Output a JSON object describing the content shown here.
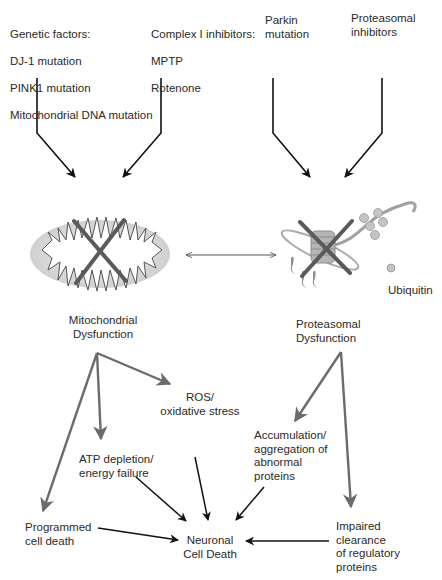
{
  "diagram": {
    "inputs": {
      "genetic": {
        "title": "Genetic factors:",
        "items": [
          "DJ-1 mutation",
          "PINK1 mutation",
          "Mitochondrial DNA mutation"
        ]
      },
      "complex1": {
        "title": "Complex I inhibitors:",
        "items": [
          "MPTP",
          "Rotenone"
        ]
      },
      "parkin": {
        "text": "Parkin\nmutation"
      },
      "proteasomal_inhibitors": {
        "text": "Proteasomal\ninhibitors"
      }
    },
    "organelles": {
      "mitochondrion": {
        "label": "Mitochondrial\nDysfunction",
        "blocked": true
      },
      "proteasome": {
        "label": "Proteasomal\nDysfunction",
        "blocked": true,
        "ubiquitin_label": "Ubiquitin"
      }
    },
    "outcomes": {
      "ros": "ROS/\noxidative stress",
      "atp": "ATP depletion/\nenergy failure",
      "programmed": "Programmed\ncell death",
      "accumulation": "Accumulation/\naggregation of\nabnormal\nproteins",
      "impaired": "Impaired\nclearance\nof regulatory\nproteins",
      "final": "Neuronal\nCell Death"
    },
    "colors": {
      "black_arrow": "#111111",
      "gray_arrow": "#6b6b6b",
      "cross": "#5a5a5a",
      "mito_fill": "#d9d9d9",
      "proteasome": "#a8a8a8"
    }
  }
}
